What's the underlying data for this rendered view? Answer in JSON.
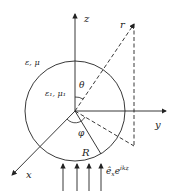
{
  "diagram": {
    "axes": {
      "z": "z",
      "y": "y",
      "x": "x"
    },
    "regions": {
      "outer": "ε, μ",
      "inner": "ε₁, μ₁"
    },
    "angles": {
      "theta": "θ",
      "phi": "φ"
    },
    "labels": {
      "r": "r",
      "radius": "R",
      "incident_wave": "ê",
      "incident_sub": "x",
      "incident_exp": "e",
      "incident_sup": "ikz"
    }
  }
}
